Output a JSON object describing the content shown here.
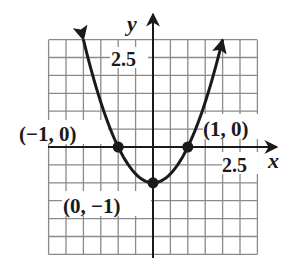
{
  "chart_data": {
    "type": "line",
    "title": "",
    "xlabel": "x",
    "ylabel": "y",
    "function": "y = x^2 - 1",
    "xlim": [
      -3,
      3
    ],
    "ylim": [
      -3,
      3
    ],
    "grid": true,
    "grid_step": 0.5,
    "tick_labels": {
      "x": [
        {
          "value": 2.5,
          "label": "2.5"
        }
      ],
      "y": [
        {
          "value": 2.5,
          "label": "2.5"
        }
      ]
    },
    "series": [
      {
        "name": "parabola",
        "x_range": [
          -2,
          2
        ],
        "arrows_at_ends": true,
        "points": [
          {
            "x": -2,
            "y": 3
          },
          {
            "x": -1.5,
            "y": 1.25
          },
          {
            "x": -1,
            "y": 0
          },
          {
            "x": -0.5,
            "y": -0.75
          },
          {
            "x": 0,
            "y": -1
          },
          {
            "x": 0.5,
            "y": -0.75
          },
          {
            "x": 1,
            "y": 0
          },
          {
            "x": 1.5,
            "y": 1.25
          },
          {
            "x": 2,
            "y": 3
          }
        ]
      }
    ],
    "annotations": [
      {
        "x": -1,
        "y": 0,
        "label": "(−1, 0)"
      },
      {
        "x": 1,
        "y": 0,
        "label": "(1, 0)"
      },
      {
        "x": 0,
        "y": -1,
        "label": "(0, −1)"
      }
    ],
    "legend": null
  },
  "labels": {
    "x_axis": "x",
    "y_axis": "y",
    "x_tick": "2.5",
    "y_tick": "2.5",
    "pt_left": "(−1, 0)",
    "pt_right": "(1, 0)",
    "pt_vertex": "(0, −1)"
  },
  "colors": {
    "grid": "#8a8a8a",
    "axis": "#1a1a1a",
    "curve": "#1a1a1a",
    "background": "#ffffff"
  }
}
